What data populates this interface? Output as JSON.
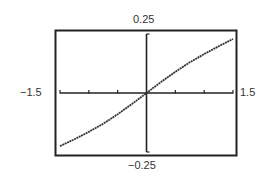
{
  "chart_data": {
    "type": "line",
    "title": "",
    "xlabel": "",
    "ylabel": "",
    "xlim": [
      -1.5,
      1.5
    ],
    "ylim": [
      -0.25,
      0.25
    ],
    "window_labels": {
      "ymax": "0.25",
      "ymin": "−0.25",
      "xmin": "−1.5",
      "xmax": "1.5"
    },
    "x_ticks": [
      -1.5,
      -1.0,
      -0.5,
      0.5,
      1.0,
      1.5
    ],
    "grid": false,
    "legend": null,
    "series": [
      {
        "name": "curve",
        "x": [
          -1.5,
          -1.25,
          -1.0,
          -0.75,
          -0.5,
          -0.25,
          0.0,
          0.25,
          0.5,
          0.75,
          1.0,
          1.25,
          1.5
        ],
        "y": [
          -0.225,
          -0.196,
          -0.165,
          -0.13,
          -0.09,
          -0.046,
          0.0,
          0.046,
          0.09,
          0.13,
          0.165,
          0.198,
          0.229
        ]
      }
    ]
  }
}
